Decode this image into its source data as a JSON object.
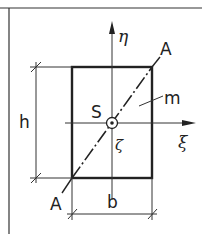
{
  "diagram": {
    "colors": {
      "line": "#222222",
      "background": "#ffffff"
    },
    "labels": {
      "eta_axis": "η",
      "xi_axis": "ξ",
      "zeta_axis": "ζ",
      "centroid": "S",
      "diagonal_end_top": "A",
      "diagonal_end_bottom": "A",
      "line_m": "m",
      "height": "h",
      "width": "b"
    }
  }
}
